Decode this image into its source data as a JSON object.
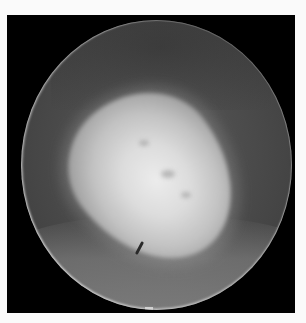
{
  "image": {
    "description": "Grayscale circular endoscopic view showing a bright ovoid mass on a darker gray background within a black rectangular frame",
    "colors": {
      "page_background": "#fafafa",
      "frame": "#000000",
      "field_background": "#4c4c4c",
      "mass_highlight": "#ececec",
      "lower_band": "#969696"
    }
  }
}
